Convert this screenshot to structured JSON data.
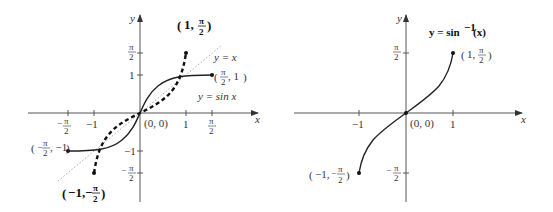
{
  "left_plot": {
    "axes": {
      "x_label": "x",
      "y_label": "y"
    },
    "x_ticks": [
      {
        "label_num": "π",
        "label_den": "2",
        "sign": "−",
        "value": -1.5708
      },
      {
        "label": "−1",
        "value": -1
      },
      {
        "label": "1",
        "value": 1
      },
      {
        "label_num": "π",
        "label_den": "2",
        "sign": "",
        "value": 1.5708
      }
    ],
    "y_ticks": [
      {
        "label_num": "π",
        "label_den": "2",
        "sign": "",
        "value": 1.5708
      },
      {
        "label": "1",
        "value": 1
      },
      {
        "label": "−1",
        "value": -1
      },
      {
        "label_num": "π",
        "label_den": "2",
        "sign": "−",
        "value": -1.5708
      }
    ],
    "origin_label": "(0, 0)",
    "curve_labels": {
      "identity": "y = x",
      "sine": "y = sin x"
    },
    "point_labels": {
      "sine_right": "(π/2, 1)",
      "sine_left": "(−π/2, −1)",
      "arcsin_top": "(1, π/2)",
      "arcsin_bottom": "(−1, −π/2)"
    }
  },
  "right_plot": {
    "title": "y = sin⁻¹ (x)",
    "axes": {
      "x_label": "x",
      "y_label": "y"
    },
    "x_ticks": [
      {
        "label": "−1",
        "value": -1
      },
      {
        "label": "1",
        "value": 1
      }
    ],
    "y_ticks": [
      {
        "label_num": "π",
        "label_den": "2",
        "sign": "",
        "value": 1.5708
      },
      {
        "label_num": "π",
        "label_den": "2",
        "sign": "−",
        "value": -1.5708
      }
    ],
    "origin_label": "(0, 0)",
    "point_labels": {
      "top": "(1, π/2)",
      "bottom": "(−1, −π/2)"
    }
  },
  "text": {
    "x": "x",
    "y": "y",
    "pi": "π",
    "two": "2",
    "minus": "−",
    "one": "1",
    "neg_one": "−1",
    "origin": "(0, 0)",
    "y_eq_x": "y = x",
    "y_eq_sinx": "y = sin x",
    "title_right": "y = sin",
    "title_sup": "−1",
    "title_arg": " (x)",
    "lp": "(",
    "rp": ")",
    "pt_1": "1,",
    "pt_neg1": "−1,",
    "pt_comma1": ", 1",
    "pt_commaneg1": ", −1"
  }
}
